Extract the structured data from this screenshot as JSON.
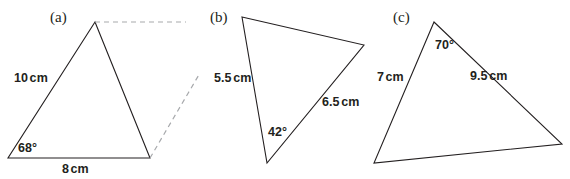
{
  "figure": {
    "background_color": "#ffffff",
    "stroke_color": "#231f20",
    "dashed_color": "#a7a9ac",
    "text_color": "#231f20"
  },
  "triangles": [
    {
      "key": "a",
      "label": "(a)",
      "points": "95,22 8,158 150,158",
      "side_labels": [
        {
          "text": "10 cm",
          "x": 14,
          "y": 72
        },
        {
          "text": "8 cm",
          "x": 62,
          "y": 163
        }
      ],
      "angle_labels": [
        {
          "text": "68°",
          "x": 18,
          "y": 142
        }
      ],
      "dashed": [
        {
          "x1": 95,
          "y1": 22,
          "x2": 186,
          "y2": 22
        },
        {
          "x1": 150,
          "y1": 158,
          "x2": 200,
          "y2": 73
        }
      ],
      "label_x": 50,
      "label_y": 10
    },
    {
      "key": "b",
      "label": "(b)",
      "points": "242,17 364,45 267,163",
      "side_labels": [
        {
          "text": "5.5 cm",
          "x": 214,
          "y": 72
        },
        {
          "text": "6.5 cm",
          "x": 322,
          "y": 96
        }
      ],
      "angle_labels": [
        {
          "text": "42°",
          "x": 268,
          "y": 126
        }
      ],
      "dashed": [],
      "label_x": 210,
      "label_y": 10
    },
    {
      "key": "c",
      "label": "(c)",
      "points": "434,22 562,144 374,163",
      "side_labels": [
        {
          "text": "7 cm",
          "x": 377,
          "y": 71
        },
        {
          "text": "9.5 cm",
          "x": 470,
          "y": 70
        }
      ],
      "angle_labels": [
        {
          "text": "70°",
          "x": 435,
          "y": 39
        }
      ],
      "dashed": [],
      "label_x": 393,
      "label_y": 10
    }
  ]
}
